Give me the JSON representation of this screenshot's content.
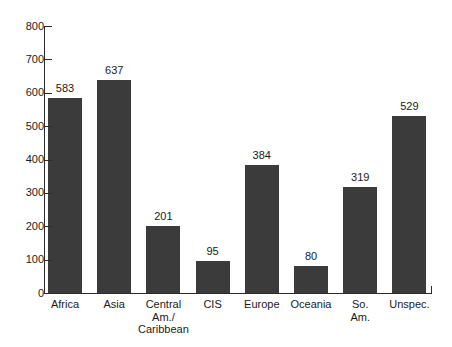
{
  "chart_data": {
    "type": "bar",
    "title": "",
    "xlabel": "",
    "ylabel": "",
    "ylim": [
      0,
      800
    ],
    "ytick_step": 100,
    "yticks": [
      800,
      700,
      600,
      500,
      400,
      300,
      200,
      100,
      0
    ],
    "grid": false,
    "legend": null,
    "bar_color": "#3b3b3b",
    "axis_color": "#2b2b2b",
    "background": "#ffffff",
    "value_labels_shown": true,
    "categories": [
      "Africa",
      "Central Am./Caribbean",
      "Asia",
      "CIS",
      "Europe",
      "Oceania",
      "So. Am.",
      "Unspec."
    ],
    "bars": [
      {
        "label": "Africa",
        "label_lines": [
          "Africa"
        ],
        "value": 583,
        "value_text": "583"
      },
      {
        "label": "Asia",
        "label_lines": [
          "Asia"
        ],
        "value": 637,
        "value_text": "637"
      },
      {
        "label": "Central Am./Caribbean",
        "label_lines": [
          "Central",
          "Am./",
          "Caribbean"
        ],
        "value": 201,
        "value_text": "201"
      },
      {
        "label": "CIS",
        "label_lines": [
          "CIS"
        ],
        "value": 95,
        "value_text": "95"
      },
      {
        "label": "Europe",
        "label_lines": [
          "Europe"
        ],
        "value": 384,
        "value_text": "384"
      },
      {
        "label": "Oceania",
        "label_lines": [
          "Oceania"
        ],
        "value": 80,
        "value_text": "80"
      },
      {
        "label": "So. Am.",
        "label_lines": [
          "So.",
          "Am."
        ],
        "value": 319,
        "value_text": "319"
      },
      {
        "label": "Unspec.",
        "label_lines": [
          "Unspec."
        ],
        "value": 529,
        "value_text": "529"
      }
    ]
  }
}
